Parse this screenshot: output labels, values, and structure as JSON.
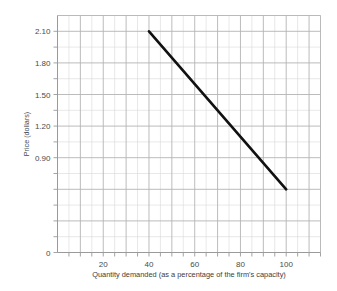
{
  "chart_data": {
    "type": "line",
    "title": "",
    "subtitle": "",
    "xlabel": "Quantity demanded (as a percentage of the firm's capacity)",
    "ylabel": "Price (dollars)",
    "xlim": [
      0,
      115
    ],
    "ylim": [
      0,
      2.25
    ],
    "grid": true,
    "legend": "none",
    "x_ticks": [
      10,
      20,
      30,
      40,
      50,
      60,
      70,
      80,
      90,
      100,
      110
    ],
    "x_tick_labels": [
      "",
      "20",
      "",
      "40",
      "",
      "60",
      "",
      "80",
      "",
      "100",
      ""
    ],
    "y_ticks": [
      0,
      0.15,
      0.3,
      0.45,
      0.6,
      0.75,
      0.9,
      1.05,
      1.2,
      1.35,
      1.5,
      1.65,
      1.8,
      1.95,
      2.1
    ],
    "y_tick_labels": [
      "0",
      "",
      "",
      "",
      "",
      "",
      "0.90",
      "",
      "1.20",
      "",
      "1.50",
      "",
      "1.80",
      "",
      "2.10"
    ],
    "series": [
      {
        "name": "Demand curve",
        "color": "#111111",
        "width": 2.6,
        "x": [
          40,
          100
        ],
        "values": [
          2.1,
          0.6
        ]
      }
    ],
    "annotations": []
  },
  "axes": {
    "y_labels": [
      "2.10",
      "1.80",
      "1.50",
      "1.20",
      "0.90",
      "0"
    ],
    "x_labels": [
      "20",
      "40",
      "60",
      "80",
      "100"
    ],
    "y_title": "Price (dollars)",
    "x_title": "Quantity demanded (as a percentage of the firm's capacity)"
  },
  "colors": {
    "background": "#ffffff",
    "grid_minor": "#d8d8d8",
    "grid_major": "#b4b4b4",
    "axis": "#9a9a9a",
    "line": "#111111",
    "text": "#4a4a4a"
  }
}
